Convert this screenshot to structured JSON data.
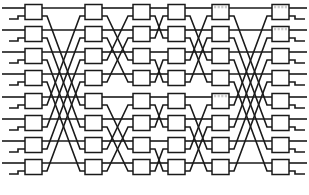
{
  "figure": {
    "name": "benes-interconnection-network",
    "title": "",
    "width": 309,
    "height": 195,
    "background_color": "#ffffff",
    "line_color": "#1a1a1a",
    "box_fill_color": "#ffffff"
  },
  "network": {
    "type": "multistage-interconnection-network",
    "topology": "benes",
    "rows": 8,
    "stage_count": 6,
    "switch_size": "2x2",
    "row_y": [
      12,
      34,
      56,
      78,
      101,
      123,
      145,
      167
    ],
    "box_width": 17,
    "box_height": 15,
    "stages": [
      {
        "index": 0,
        "label": "",
        "box_x": 25,
        "shuffle_span": 4,
        "shaded": false
      },
      {
        "index": 1,
        "label": "",
        "box_x": 85,
        "shuffle_span": 2,
        "shaded": false
      },
      {
        "index": 2,
        "label": "",
        "box_x": 133,
        "shuffle_span": 1,
        "shaded": false
      },
      {
        "index": 3,
        "label": "",
        "box_x": 168,
        "shuffle_span": 2,
        "shaded": false
      },
      {
        "index": 4,
        "label": "",
        "box_x": 212,
        "shuffle_span": 4,
        "shaded": true
      },
      {
        "index": 5,
        "label": "",
        "box_x": 272,
        "shuffle_span": 0,
        "shaded": true
      }
    ],
    "stub": {
      "input_lead_length": 25,
      "output_lead_length": 20,
      "port_offset": 4
    },
    "shaded_boxes": [
      {
        "stage": 4,
        "row": 0
      },
      {
        "stage": 4,
        "row": 4
      },
      {
        "stage": 5,
        "row": 0
      },
      {
        "stage": 5,
        "row": 1
      }
    ]
  }
}
